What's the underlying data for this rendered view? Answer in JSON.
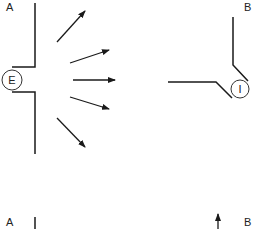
{
  "diagram": {
    "panels": [
      {
        "id": "top-left",
        "label": "A",
        "circle_label": "E",
        "description": "wall with opening, circle E, arrows radiating outward"
      },
      {
        "id": "top-right",
        "label": "B",
        "circle_label": "I",
        "description": "angled walls meeting at circle I"
      },
      {
        "id": "bottom-left",
        "label": "A"
      },
      {
        "id": "bottom-right",
        "label": "B"
      }
    ],
    "arrow_count": 5,
    "colors": {
      "stroke": "#1a1a1a",
      "background": "#ffffff"
    }
  }
}
